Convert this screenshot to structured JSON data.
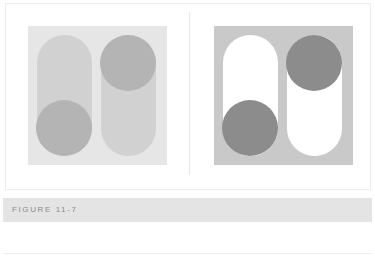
{
  "figure": {
    "caption": "FIGURE 11-7",
    "panels": [
      {
        "name": "low-contrast",
        "background": "#e6e6e6",
        "pill_color": "#d1d1d1",
        "circle_color": "#b4b4b4"
      },
      {
        "name": "high-contrast",
        "background": "#c9c9c9",
        "pill_color": "#ffffff",
        "circle_color": "#8c8c8c"
      }
    ]
  }
}
